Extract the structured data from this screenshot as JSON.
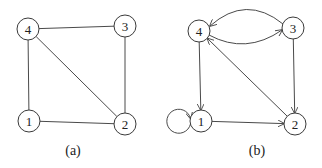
{
  "graphs": [
    {
      "caption": "(a)",
      "directed": false,
      "nodes": [
        {
          "id": "1",
          "label": "1",
          "x": 29,
          "y": 121
        },
        {
          "id": "2",
          "label": "2",
          "x": 125,
          "y": 124
        },
        {
          "id": "3",
          "label": "3",
          "x": 125,
          "y": 26
        },
        {
          "id": "4",
          "label": "4",
          "x": 28,
          "y": 29
        }
      ],
      "edges": [
        {
          "from": "4",
          "to": "3"
        },
        {
          "from": "4",
          "to": "1"
        },
        {
          "from": "4",
          "to": "2"
        },
        {
          "from": "3",
          "to": "2"
        },
        {
          "from": "1",
          "to": "2"
        }
      ]
    },
    {
      "caption": "(b)",
      "directed": true,
      "nodes": [
        {
          "id": "1",
          "label": "1",
          "x": 201,
          "y": 121
        },
        {
          "id": "2",
          "label": "2",
          "x": 295,
          "y": 124
        },
        {
          "id": "3",
          "label": "3",
          "x": 293,
          "y": 28
        },
        {
          "id": "4",
          "label": "4",
          "x": 199,
          "y": 31
        }
      ],
      "edges": [
        {
          "from": "3",
          "to": "4",
          "curve": "upper"
        },
        {
          "from": "4",
          "to": "3",
          "curve": "lower"
        },
        {
          "from": "2",
          "to": "4"
        },
        {
          "from": "4",
          "to": "1"
        },
        {
          "from": "3",
          "to": "2"
        },
        {
          "from": "1",
          "to": "2"
        },
        {
          "from": "1",
          "to": "1",
          "self_loop": true
        }
      ]
    }
  ]
}
